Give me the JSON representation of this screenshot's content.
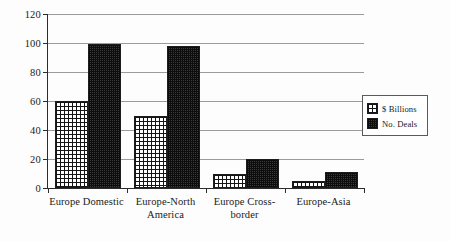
{
  "chart_data": {
    "type": "bar",
    "title": "",
    "subtitle": "",
    "xlabel": "",
    "ylabel": "",
    "ylim": [
      0,
      120
    ],
    "ytick_labels": [
      "0",
      "20",
      "40",
      "60",
      "80",
      "100",
      "120"
    ],
    "ytick_values": [
      0,
      20,
      40,
      60,
      80,
      100,
      120
    ],
    "grid": true,
    "legend_position": "right",
    "categories": [
      "Europe Domestic",
      "Europe-North\nAmerica",
      "Europe Cross-\nborder",
      "Europe-Asia"
    ],
    "series": [
      {
        "name": "$ Billions",
        "pattern": "cross-hatch",
        "color": "#ffffff",
        "values": [
          60,
          50,
          10,
          5
        ]
      },
      {
        "name": "No. Deals",
        "pattern": "dense-stipple",
        "color": "#3a3a3a",
        "values": [
          99,
          98,
          20,
          11
        ]
      }
    ]
  },
  "legend": {
    "items": [
      {
        "label": "$ Billions",
        "swatch": "cross-hatch-swatch"
      },
      {
        "label": "No. Deals",
        "swatch": "dense-stipple-swatch"
      }
    ]
  },
  "axes": {
    "y_axis_name": "value-axis",
    "x_axis_name": "category-axis"
  }
}
